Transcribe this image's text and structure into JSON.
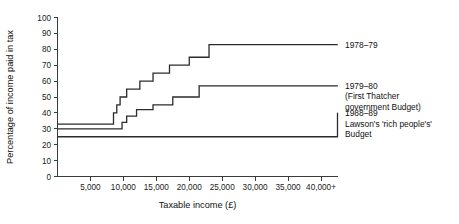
{
  "chart_data": {
    "type": "line",
    "subtype": "step-post",
    "title": "",
    "xlabel": "Taxable income (£)",
    "ylabel": "Percentage of income paid in tax",
    "xlim": [
      0,
      42500
    ],
    "ylim": [
      0,
      100
    ],
    "grid": false,
    "legend_position": "right",
    "x_tick_values": [
      5000,
      10000,
      15000,
      20000,
      25000,
      30000,
      35000,
      40000
    ],
    "x_tick_labels": [
      "5,000",
      "10,000",
      "15,000",
      "20,000",
      "25,000",
      "30,000",
      "35,000",
      "40,000+"
    ],
    "y_tick_values": [
      0,
      10,
      20,
      30,
      40,
      50,
      60,
      70,
      80,
      90,
      100
    ],
    "y_tick_labels": [
      "0",
      "10",
      "20",
      "30",
      "40",
      "50",
      "60",
      "70",
      "80",
      "90",
      "100"
    ],
    "series": [
      {
        "name": "1978-79",
        "legend_label": "1978–79",
        "legend_sublabels": [],
        "color": "#2b2b2b",
        "x": [
          0,
          7500,
          8500,
          9000,
          9500,
          10500,
          12500,
          14500,
          17000,
          20000,
          23000,
          42500
        ],
        "y": [
          33,
          33,
          40,
          45,
          50,
          55,
          60,
          65,
          70,
          75,
          83,
          83
        ]
      },
      {
        "name": "1979-80",
        "legend_label": "1979–80",
        "legend_sublabels": [
          "(First Thatcher",
          "government Budget)"
        ],
        "color": "#2b2b2b",
        "x": [
          0,
          9000,
          9800,
          10500,
          12000,
          14500,
          17500,
          21500,
          42500
        ],
        "y": [
          30,
          30,
          34,
          38,
          42,
          45,
          50,
          57,
          57
        ]
      },
      {
        "name": "1988-89",
        "legend_label": "1988–89",
        "legend_sublabels": [
          "Lawson's 'rich people's'",
          "Budget"
        ],
        "color": "#2b2b2b",
        "x": [
          0,
          20500,
          42500
        ],
        "y": [
          25,
          25,
          40
        ]
      }
    ]
  },
  "legend": [
    {
      "label": "1978–79",
      "lines": [
        "1978–79"
      ]
    },
    {
      "label": "1979–80",
      "lines": [
        "1979–80",
        "(First Thatcher",
        "government Budget)"
      ]
    },
    {
      "label": "1988–89",
      "lines": [
        "1988–89",
        "Lawson's 'rich people's'",
        "Budget"
      ]
    }
  ],
  "axes": {
    "x_title": "Taxable income (£)",
    "y_title": "Percentage of income paid in tax"
  },
  "colors": {
    "line": "#2b2b2b",
    "axis": "#3a3a3a",
    "text": "#111111",
    "background": "#ffffff"
  }
}
